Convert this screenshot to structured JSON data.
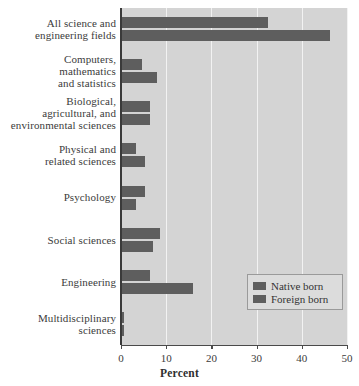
{
  "chart_data": {
    "type": "bar",
    "orientation": "horizontal",
    "title": "",
    "xlabel": "Percent",
    "ylabel": "",
    "xlim": [
      0,
      50
    ],
    "xticks": [
      0,
      10,
      20,
      30,
      40,
      50
    ],
    "xtick_labels": [
      "0",
      "10",
      "20",
      "30",
      "40",
      "50"
    ],
    "grid": true,
    "legend_position": "bottom-right",
    "categories": [
      "All science and engineering fields",
      "Computers, mathematics and statistics",
      "Biological, agricultural, and environmental sciences",
      "Physical and related sciences",
      "Psychology",
      "Social sciences",
      "Engineering",
      "Multidisciplinary sciences"
    ],
    "category_lines": [
      [
        "All science and",
        "engineering fields"
      ],
      [
        "Computers,",
        "mathematics",
        "and statistics"
      ],
      [
        "Biological,",
        "agricultural, and",
        "environmental sciences"
      ],
      [
        "Physical and",
        "related sciences"
      ],
      [
        "Psychology"
      ],
      [
        "Social sciences"
      ],
      [
        "Engineering"
      ],
      [
        "Multidisciplinary",
        "sciences"
      ]
    ],
    "series": [
      {
        "name": "Native born",
        "color": "#5e5e5e",
        "values": [
          32.5,
          4.7,
          6.4,
          3.3,
          5.3,
          8.7,
          6.4,
          0.6
        ]
      },
      {
        "name": "Foreign born",
        "color": "#5e5e5e",
        "values": [
          46.3,
          8.0,
          6.5,
          5.3,
          3.3,
          7.0,
          16.0,
          0.6
        ]
      }
    ]
  },
  "legend": {
    "items": [
      {
        "label": "Native born",
        "color": "#5e5e5e"
      },
      {
        "label": "Foreign born",
        "color": "#5e5e5e"
      }
    ]
  },
  "axis": {
    "x_title": "Percent",
    "tick_labels": [
      "0",
      "10",
      "20",
      "30",
      "40",
      "50"
    ]
  },
  "colors": {
    "bar": "#5e5e5e",
    "plot_background": "#d4d4d4",
    "gridline": "#f2f2f2",
    "axis": "#3a3a3a",
    "page_background": "#ffffff",
    "legend_background": "#dcdcdc",
    "legend_border": "#9a9a9a"
  }
}
